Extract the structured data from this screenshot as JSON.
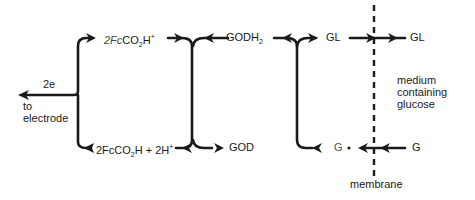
{
  "diagram": {
    "nodes": {
      "fc_oxidized": {
        "prefix": "2Fc",
        "main": "CO",
        "sub": "2",
        "tail": "H",
        "sup": "+"
      },
      "fc_reduced": {
        "prefix": "2FcCO",
        "sub": "2",
        "tail": "H + 2H",
        "sup": "+"
      },
      "godh2": {
        "main": "GODH",
        "sub": "2"
      },
      "god": "GOD",
      "gl_inner": "GL",
      "gl_outer": "GL",
      "g_inner": "G",
      "g_outer": "G"
    },
    "labels": {
      "electrons": "2e",
      "to_electrode_line1": "to",
      "to_electrode_line2": "electrode",
      "medium_line1": "medium",
      "medium_line2": "containing",
      "medium_line3": "glucose",
      "membrane": "membrane"
    },
    "colors": {
      "ink": "#1a1a1a",
      "background": "#ffffff"
    }
  }
}
